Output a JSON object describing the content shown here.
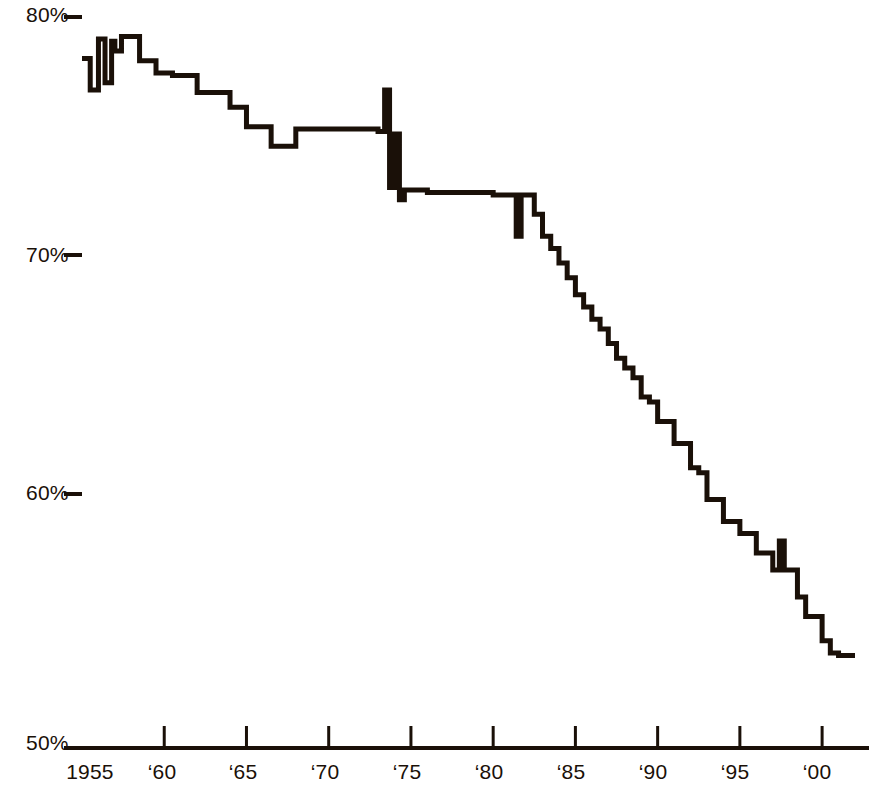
{
  "chart_data": {
    "type": "line",
    "title": "",
    "xlabel": "",
    "ylabel": "",
    "xlim": [
      1955,
      2002
    ],
    "ylim": [
      50,
      80
    ],
    "grid": false,
    "legend": null,
    "y_ticks": [
      {
        "value": 80,
        "label": "80%"
      },
      {
        "value": 70,
        "label": "70%"
      },
      {
        "value": 60,
        "label": "60%"
      },
      {
        "value": 50,
        "label": "50%"
      }
    ],
    "x_ticks": [
      {
        "value": 1955,
        "label": "1955"
      },
      {
        "value": 1960,
        "label": "‘60"
      },
      {
        "value": 1965,
        "label": "‘65"
      },
      {
        "value": 1970,
        "label": "‘70"
      },
      {
        "value": 1975,
        "label": "‘75"
      },
      {
        "value": 1980,
        "label": "‘80"
      },
      {
        "value": 1985,
        "label": "‘85"
      },
      {
        "value": 1990,
        "label": "‘90"
      },
      {
        "value": 1995,
        "label": "‘95"
      },
      {
        "value": 2000,
        "label": "‘00"
      }
    ],
    "line_color": "#1a1008",
    "line_width": 5,
    "series": [
      {
        "name": "percent",
        "x": [
          1955,
          1955.5,
          1956,
          1956.4,
          1956.8,
          1957,
          1957.4,
          1958,
          1958.5,
          1959,
          1959.5,
          1960,
          1960.5,
          1961,
          1962,
          1963,
          1964,
          1964.5,
          1965,
          1965.5,
          1966,
          1966.5,
          1967,
          1968,
          1969,
          1970,
          1971,
          1972,
          1973,
          1973.4,
          1973.7,
          1974,
          1974.3,
          1974.6,
          1975,
          1976,
          1977,
          1978,
          1979,
          1980,
          1981,
          1981.4,
          1981.7,
          1982,
          1982.5,
          1983,
          1983.5,
          1984,
          1984.5,
          1985,
          1985.5,
          1986,
          1986.5,
          1987,
          1987.5,
          1988,
          1988.5,
          1989,
          1989.5,
          1990,
          1990.5,
          1991,
          1991.5,
          1992,
          1992.5,
          1993,
          1993.5,
          1994,
          1994.5,
          1995,
          1995.5,
          1996,
          1996.5,
          1997,
          1997.4,
          1997.7,
          1998,
          1998.5,
          1999,
          1999.5,
          2000,
          2000.5,
          2001,
          2002
        ],
        "y": [
          78.3,
          77.0,
          79.1,
          77.3,
          79.0,
          78.6,
          79.2,
          79.2,
          78.2,
          78.2,
          77.7,
          77.7,
          77.6,
          77.6,
          76.9,
          76.9,
          76.3,
          76.3,
          75.5,
          75.5,
          75.5,
          74.7,
          74.7,
          75.4,
          75.4,
          75.4,
          75.4,
          75.4,
          75.3,
          77.0,
          73.0,
          75.2,
          72.5,
          72.9,
          72.9,
          72.8,
          72.8,
          72.8,
          72.8,
          72.7,
          72.7,
          71.0,
          72.7,
          72.7,
          71.9,
          71.0,
          70.5,
          69.9,
          69.3,
          68.6,
          68.1,
          67.6,
          67.2,
          66.6,
          66.0,
          65.6,
          65.2,
          64.4,
          64.2,
          63.4,
          63.4,
          62.5,
          62.5,
          61.5,
          61.3,
          60.2,
          60.2,
          59.3,
          59.3,
          58.8,
          58.8,
          58.0,
          58.0,
          57.3,
          58.5,
          57.3,
          57.3,
          56.2,
          55.4,
          55.4,
          54.4,
          53.9,
          53.8,
          53.8
        ]
      }
    ]
  }
}
